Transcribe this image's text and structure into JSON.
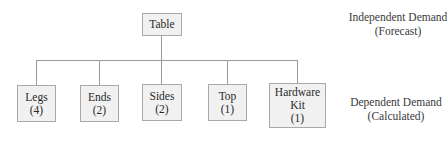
{
  "diagram": {
    "type": "bill-of-materials-tree",
    "root": {
      "label": "Table"
    },
    "children": [
      {
        "label": "Legs",
        "qty": "(4)"
      },
      {
        "label": "Ends",
        "qty": "(2)"
      },
      {
        "label": "Sides",
        "qty": "(2)"
      },
      {
        "label": "Top",
        "qty": "(1)"
      },
      {
        "label": "Hardware",
        "label2": "Kit",
        "qty": "(1)"
      }
    ],
    "annotations": {
      "independent": {
        "line1": "Independent Demand",
        "line2": "(Forecast)"
      },
      "dependent": {
        "line1": "Dependent Demand",
        "line2": "(Calculated)"
      }
    },
    "colors": {
      "box_fill": "#f1f1f1",
      "box_border": "#a9a9a9",
      "connector": "#9a9a9a",
      "text": "#2a2a2a"
    }
  }
}
